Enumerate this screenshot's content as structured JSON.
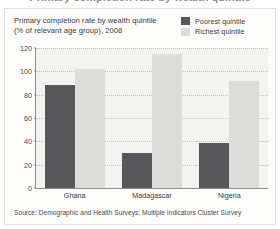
{
  "clipped_heading": "Primary completion rate by wealth quintile",
  "chart": {
    "title_line1": "Primary completion rate by wealth quintile",
    "title_line2": "(% of relevant age group), 2008",
    "source": "Source: Demographic and Health Surveys; Multiple Indicators Cluster Survey",
    "colors": {
      "poorest": "#58585a",
      "richest": "#dcdcda",
      "plot_background": "#f3f3f1",
      "axis": "#8d8d8a",
      "gridline": "#c2c2bd",
      "card_background": "#fdfdfc",
      "card_border": "#e2e2de",
      "text": "#3a3a38"
    }
  },
  "chart_data": {
    "type": "bar",
    "title": "Primary completion rate by wealth quintile (% of relevant age group), 2008",
    "xlabel": "",
    "ylabel": "",
    "ylim": [
      0,
      120
    ],
    "yticks": [
      0,
      20,
      40,
      60,
      80,
      100,
      120
    ],
    "ytick_labels": [
      "0",
      "20",
      "40",
      "60",
      "80",
      "100",
      "120"
    ],
    "grid": true,
    "legend_position": "top-right",
    "categories": [
      "Ghana",
      "Madagascar",
      "Nigeria"
    ],
    "series": [
      {
        "name": "Poorest quintile",
        "color": "#58585a",
        "values": [
          88,
          30,
          39
        ]
      },
      {
        "name": "Richest quintile",
        "color": "#dcdcda",
        "values": [
          102,
          115,
          92
        ]
      }
    ],
    "source": "Source: Demographic and Health Surveys; Multiple Indicators Cluster Survey"
  }
}
